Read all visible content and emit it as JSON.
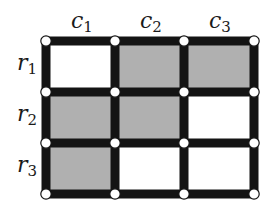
{
  "diagram": {
    "columns": [
      {
        "label": "c",
        "sub": "1"
      },
      {
        "label": "c",
        "sub": "2"
      },
      {
        "label": "c",
        "sub": "3"
      }
    ],
    "rows": [
      {
        "label": "r",
        "sub": "1"
      },
      {
        "label": "r",
        "sub": "2"
      },
      {
        "label": "r",
        "sub": "3"
      }
    ],
    "cells": [
      [
        false,
        true,
        true
      ],
      [
        true,
        true,
        false
      ],
      [
        true,
        false,
        false
      ]
    ],
    "colors": {
      "filled": "#b0b0b0",
      "empty": "#ffffff",
      "line": "#141414",
      "node_fill": "#ffffff",
      "node_stroke": "#141414"
    },
    "grid_x": [
      46,
      115,
      184,
      254
    ],
    "grid_y": [
      41,
      92,
      143,
      194
    ]
  }
}
